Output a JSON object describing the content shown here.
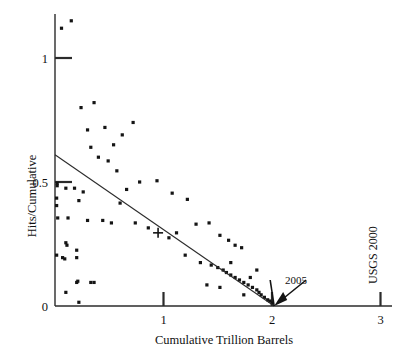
{
  "chart_data": {
    "type": "scatter",
    "title": "",
    "xlabel": "Cumulative Trillion Barrels",
    "ylabel": "Hits/Cumulative",
    "xlim": [
      0,
      3.1
    ],
    "ylim": [
      0,
      1.2
    ],
    "xticks": [
      1,
      2,
      3
    ],
    "xtick_labels": [
      "1",
      "2",
      "3"
    ],
    "yticks": [
      0,
      0.5,
      1
    ],
    "ytick_labels": [
      "0",
      "0.5",
      "1"
    ],
    "grid": false,
    "legend": "none",
    "series": [
      {
        "name": "Hits per cumulative discovery",
        "marker": "square-dot",
        "points": [
          [
            0.06,
            1.12
          ],
          [
            0.15,
            1.15
          ],
          [
            0.24,
            0.8
          ],
          [
            0.36,
            0.82
          ],
          [
            0.3,
            0.71
          ],
          [
            0.46,
            0.72
          ],
          [
            0.33,
            0.64
          ],
          [
            0.54,
            0.65
          ],
          [
            0.62,
            0.69
          ],
          [
            0.72,
            0.74
          ],
          [
            0.4,
            0.6
          ],
          [
            0.49,
            0.585
          ],
          [
            0.57,
            0.545
          ],
          [
            0.02,
            0.495
          ],
          [
            0.02,
            0.485
          ],
          [
            0.1,
            0.475
          ],
          [
            0.18,
            0.475
          ],
          [
            0.26,
            0.46
          ],
          [
            0.015,
            0.435
          ],
          [
            0.22,
            0.425
          ],
          [
            0.015,
            0.405
          ],
          [
            0.78,
            0.5
          ],
          [
            0.94,
            0.505
          ],
          [
            0.66,
            0.47
          ],
          [
            1.08,
            0.455
          ],
          [
            0.025,
            0.355
          ],
          [
            0.12,
            0.355
          ],
          [
            0.3,
            0.345
          ],
          [
            0.44,
            0.345
          ],
          [
            0.52,
            0.335
          ],
          [
            0.6,
            0.415
          ],
          [
            1.22,
            0.43
          ],
          [
            0.1,
            0.255
          ],
          [
            0.11,
            0.245
          ],
          [
            0.015,
            0.205
          ],
          [
            0.07,
            0.195
          ],
          [
            0.09,
            0.19
          ],
          [
            0.2,
            0.225
          ],
          [
            0.2,
            0.195
          ],
          [
            0.74,
            0.335
          ],
          [
            0.86,
            0.315
          ],
          [
            1.3,
            0.33
          ],
          [
            1.42,
            0.335
          ],
          [
            1.12,
            0.295
          ],
          [
            1.05,
            0.275
          ],
          [
            1.52,
            0.285
          ],
          [
            1.6,
            0.265
          ],
          [
            1.66,
            0.245
          ],
          [
            1.72,
            0.235
          ],
          [
            0.1,
            0.055
          ],
          [
            0.2,
            0.095
          ],
          [
            0.22,
            0.015
          ],
          [
            0.21,
            0.1
          ],
          [
            0.33,
            0.095
          ],
          [
            0.36,
            0.095
          ],
          [
            1.2,
            0.205
          ],
          [
            1.34,
            0.175
          ],
          [
            1.44,
            0.165
          ],
          [
            1.5,
            0.155
          ],
          [
            1.55,
            0.145
          ],
          [
            1.58,
            0.135
          ],
          [
            1.62,
            0.125
          ],
          [
            1.66,
            0.115
          ],
          [
            1.7,
            0.105
          ],
          [
            1.74,
            0.095
          ],
          [
            1.62,
            0.175
          ],
          [
            1.52,
            0.075
          ],
          [
            1.78,
            0.085
          ],
          [
            1.82,
            0.075
          ],
          [
            1.8,
            0.115
          ],
          [
            1.86,
            0.065
          ],
          [
            1.88,
            0.055
          ],
          [
            1.9,
            0.045
          ],
          [
            1.93,
            0.035
          ],
          [
            1.96,
            0.025
          ],
          [
            1.98,
            0.02
          ],
          [
            2.0,
            0.012
          ],
          [
            1.86,
            0.145
          ],
          [
            1.4,
            0.085
          ],
          [
            1.74,
            0.045
          ]
        ]
      }
    ],
    "trend_line": {
      "x0": 0.0,
      "y0": 0.61,
      "x1": 2.02,
      "y1": 0.0
    },
    "cross_marker": {
      "x": 0.95,
      "y": 0.295
    },
    "annotations": [
      {
        "name": "year-2005",
        "label": "2005",
        "x": 2.02,
        "y": 0.0
      },
      {
        "name": "usgs-2000",
        "label": "USGS 2000",
        "x": 3.0,
        "orientation": "vertical"
      }
    ]
  },
  "axes": {
    "x_title": "Cumulative Trillion Barrels",
    "y_title": "Hits/Cumulative",
    "x_tick_labels": [
      "1",
      "2",
      "3"
    ],
    "y_tick_labels": [
      "1",
      "0.5",
      "0"
    ]
  },
  "labels": {
    "year_annotation": "2005",
    "usgs_annotation": "USGS 2000"
  },
  "colors": {
    "ink": "#141414",
    "background": "#ffffff"
  }
}
